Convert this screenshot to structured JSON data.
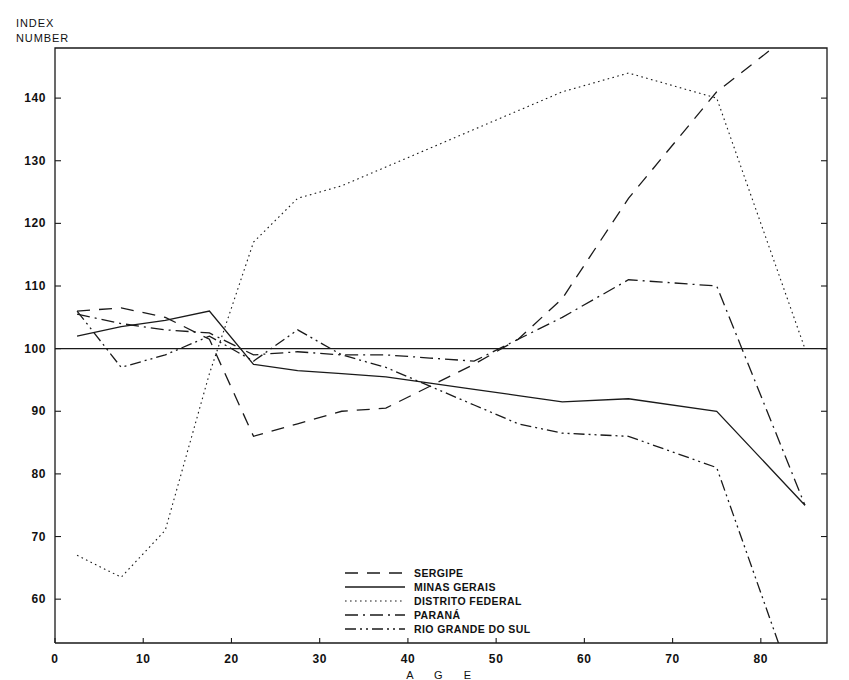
{
  "labels": {
    "index_number": "INDEX\nNUMBER",
    "age": "A G E"
  },
  "chart_data": {
    "type": "line",
    "title": "",
    "xlabel": "A G E",
    "ylabel": "INDEX NUMBER",
    "xlim": [
      0,
      87.5
    ],
    "ylim": [
      53,
      148
    ],
    "grid": false,
    "reference_line": 100,
    "legend_position": "bottom-center",
    "xticks": [
      0,
      10,
      20,
      30,
      40,
      50,
      60,
      70,
      80
    ],
    "yticks": [
      60,
      70,
      80,
      90,
      100,
      110,
      120,
      130,
      140
    ],
    "xtick_labels": [
      "0",
      "10",
      "20",
      "30",
      "40",
      "50",
      "60",
      "70",
      "80"
    ],
    "ytick_labels": [
      "60",
      "70",
      "80",
      "90",
      "100",
      "110",
      "120",
      "130",
      "140"
    ],
    "series": [
      {
        "name": "SERGIPE",
        "style": "dashed",
        "color": "#1a1a1a",
        "x": [
          2.5,
          7.5,
          12.5,
          17.5,
          22.5,
          27.5,
          32.5,
          37.5,
          42.5,
          47.5,
          52.5,
          57.5,
          65,
          75,
          85
        ],
        "y": [
          106,
          106.5,
          105,
          101.5,
          86,
          88,
          90,
          90.5,
          94,
          97.5,
          101.5,
          108,
          124,
          141,
          152
        ]
      },
      {
        "name": "MINAS GERAIS",
        "style": "solid",
        "color": "#1a1a1a",
        "x": [
          2.5,
          7.5,
          12.5,
          17.5,
          22.5,
          27.5,
          32.5,
          37.5,
          42.5,
          47.5,
          52.5,
          57.5,
          65,
          75,
          85
        ],
        "y": [
          102,
          103.5,
          104.5,
          106,
          97.5,
          96.5,
          96,
          95.5,
          94.5,
          93.5,
          92.5,
          91.5,
          92,
          90,
          75
        ]
      },
      {
        "name": "DISTRITO FEDERAL",
        "style": "dotted",
        "color": "#1a1a1a",
        "x": [
          2.5,
          7.5,
          12.5,
          17.5,
          22.5,
          27.5,
          32.5,
          37.5,
          42.5,
          47.5,
          52.5,
          57.5,
          65,
          75,
          85
        ],
        "y": [
          67,
          63.5,
          71,
          96,
          117,
          124,
          126,
          129,
          132,
          135,
          138,
          141,
          144,
          140,
          100
        ]
      },
      {
        "name": "PARANÁ",
        "style": "dashdot",
        "color": "#1a1a1a",
        "x": [
          2.5,
          7.5,
          12.5,
          17.5,
          22.5,
          27.5,
          32.5,
          37.5,
          42.5,
          47.5,
          52.5,
          57.5,
          65,
          75,
          85
        ],
        "y": [
          105.5,
          104,
          103,
          102.5,
          99,
          99.5,
          99,
          99,
          98.5,
          98,
          101.5,
          105,
          111,
          110,
          75
        ]
      },
      {
        "name": "RIO GRANDE DO SUL",
        "style": "dashdotdot",
        "color": "#1a1a1a",
        "x": [
          2.5,
          7.5,
          12.5,
          17.5,
          22.5,
          27.5,
          32.5,
          37.5,
          42.5,
          47.5,
          52.5,
          57.5,
          65,
          75,
          82
        ],
        "y": [
          106,
          97,
          99,
          102,
          98,
          103,
          99,
          97,
          94,
          91,
          88,
          86.5,
          86,
          81,
          53
        ]
      }
    ]
  },
  "legend": {
    "items": [
      {
        "label": "SERGIPE",
        "style": "dashed"
      },
      {
        "label": "MINAS GERAIS",
        "style": "solid"
      },
      {
        "label": "DISTRITO FEDERAL",
        "style": "dotted"
      },
      {
        "label": "PARANÁ",
        "style": "dashdot"
      },
      {
        "label": "RIO GRANDE DO SUL",
        "style": "dashdotdot"
      }
    ]
  }
}
